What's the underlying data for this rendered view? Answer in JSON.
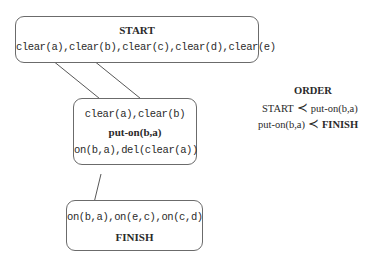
{
  "start_node": {
    "title": "START",
    "effects": "clear(a),clear(b),clear(c),clear(d),clear(e)"
  },
  "action_node": {
    "preconditions": "clear(a),clear(b)",
    "action": "put-on(b,a)",
    "effects": "on(b,a),del(clear(a))"
  },
  "finish_node": {
    "preconditions": "on(b,a),on(e,c),on(c,d)",
    "title": "FINISH"
  },
  "order": {
    "title": "ORDER",
    "constraints": [
      {
        "before": "START",
        "symbol": "≺",
        "after": "put-on(b,a)"
      },
      {
        "before": "put-on(b,a)",
        "symbol": "≺",
        "after": "FINISH"
      }
    ]
  },
  "links": [
    {
      "from": "clear(a)@START",
      "to": "clear(a)@put-on(b,a)"
    },
    {
      "from": "clear(b)@START",
      "to": "clear(b)@put-on(b,a)"
    },
    {
      "from": "on(b,a)@put-on(b,a)",
      "to": "on(b,a)@FINISH"
    }
  ]
}
